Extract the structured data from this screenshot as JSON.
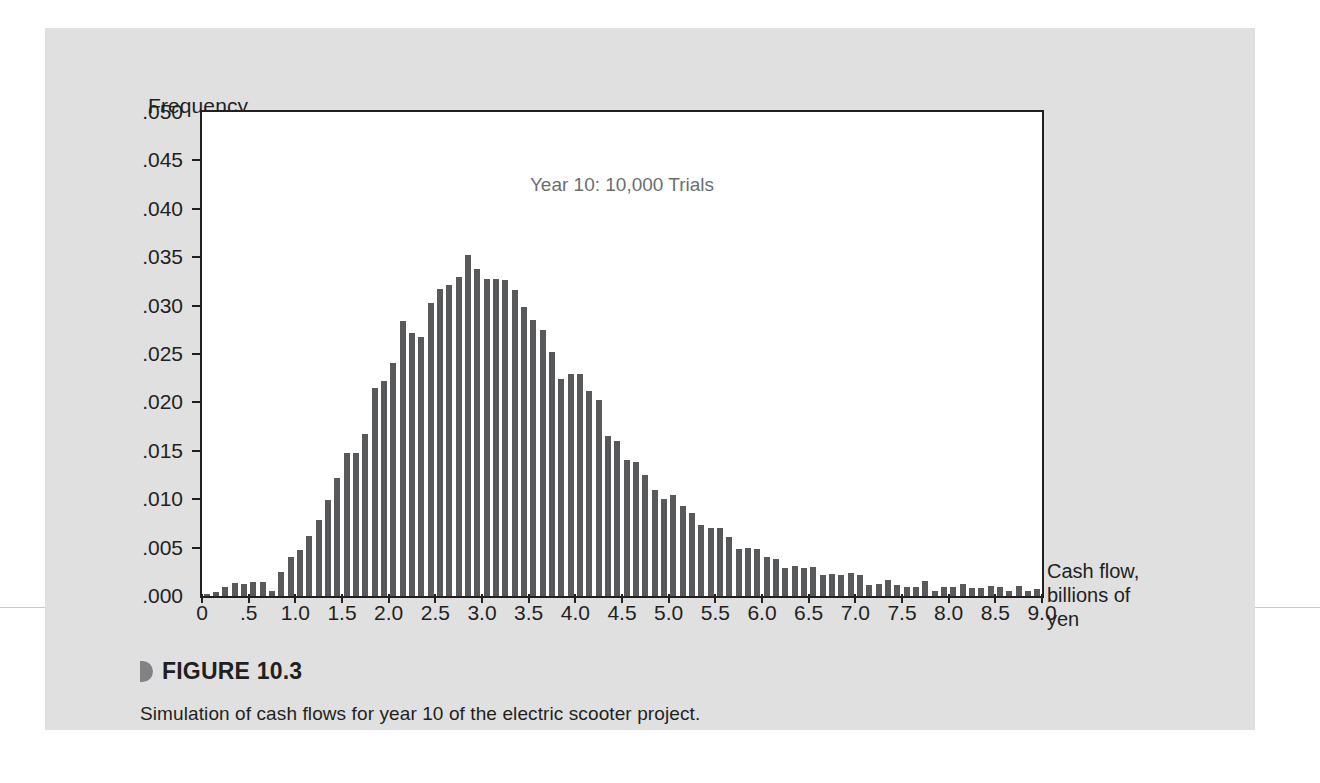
{
  "figure": {
    "label": "FIGURE 10.3",
    "caption": "Simulation of cash flows for year 10 of the electric scooter project.",
    "bullet_icon": "triangle-bullet-icon"
  },
  "colors": {
    "panel_background": "#e0e0e0",
    "plot_background": "#ffffff",
    "bar": "#58595b",
    "axis": "#231f20",
    "annotation_text": "#6d6e71"
  },
  "chart_data": {
    "type": "bar",
    "title": "Year 10: 10,000 Trials",
    "xlabel": "Cash flow, billions of yen",
    "xlabel_lines": [
      "Cash flow,",
      "billions of",
      "yen"
    ],
    "ylabel": "Frequency",
    "grid": false,
    "legend": null,
    "xlim": [
      0,
      9.0
    ],
    "ylim": [
      0.0,
      0.05
    ],
    "bin_width": 0.1,
    "xtick_labels": [
      "0",
      ".5",
      "1.0",
      "1.5",
      "2.0",
      "2.5",
      "3.0",
      "3.5",
      "4.0",
      "4.5",
      "5.0",
      "5.5",
      "6.0",
      "6.5",
      "7.0",
      "7.5",
      "8.0",
      "8.5",
      "9.0"
    ],
    "xtick_values": [
      0,
      0.5,
      1.0,
      1.5,
      2.0,
      2.5,
      3.0,
      3.5,
      4.0,
      4.5,
      5.0,
      5.5,
      6.0,
      6.5,
      7.0,
      7.5,
      8.0,
      8.5,
      9.0
    ],
    "ytick_labels": [
      ".050",
      ".045",
      ".040",
      ".035",
      ".030",
      ".025",
      ".020",
      ".015",
      ".010",
      ".005",
      ".000"
    ],
    "ytick_values": [
      0.05,
      0.045,
      0.04,
      0.035,
      0.03,
      0.025,
      0.02,
      0.015,
      0.01,
      0.005,
      0.0
    ],
    "x": [
      0.05,
      0.15,
      0.25,
      0.35,
      0.45,
      0.55,
      0.65,
      0.75,
      0.85,
      0.95,
      1.05,
      1.15,
      1.25,
      1.35,
      1.45,
      1.55,
      1.65,
      1.75,
      1.85,
      1.95,
      2.05,
      2.15,
      2.25,
      2.35,
      2.45,
      2.55,
      2.65,
      2.75,
      2.85,
      2.95,
      3.05,
      3.15,
      3.25,
      3.35,
      3.45,
      3.55,
      3.65,
      3.75,
      3.85,
      3.95,
      4.05,
      4.15,
      4.25,
      4.35,
      4.45,
      4.55,
      4.65,
      4.75,
      4.85,
      4.95,
      5.05,
      5.15,
      5.25,
      5.35,
      5.45,
      5.55,
      5.65,
      5.75,
      5.85,
      5.95,
      6.05,
      6.15,
      6.25,
      6.35,
      6.45,
      6.55,
      6.65,
      6.75,
      6.85,
      6.95,
      7.05,
      7.15,
      7.25,
      7.35,
      7.45,
      7.55,
      7.65,
      7.75,
      7.85,
      7.95,
      8.05,
      8.15,
      8.25,
      8.35,
      8.45,
      8.55,
      8.65,
      8.75,
      8.85,
      8.95
    ],
    "values": [
      0.0002,
      0.0004,
      0.0009,
      0.0013,
      0.0012,
      0.0014,
      0.0014,
      0.0005,
      0.0025,
      0.004,
      0.0048,
      0.0062,
      0.0079,
      0.0099,
      0.0122,
      0.0148,
      0.0148,
      0.0167,
      0.0215,
      0.0222,
      0.0241,
      0.0284,
      0.0272,
      0.0268,
      0.0303,
      0.0317,
      0.0321,
      0.033,
      0.0352,
      0.0338,
      0.0327,
      0.0327,
      0.0326,
      0.0316,
      0.0299,
      0.0285,
      0.0275,
      0.0252,
      0.0224,
      0.0229,
      0.0229,
      0.0212,
      0.0202,
      0.0165,
      0.016,
      0.0141,
      0.0138,
      0.0125,
      0.011,
      0.01,
      0.0104,
      0.0093,
      0.0086,
      0.0073,
      0.007,
      0.007,
      0.0061,
      0.0049,
      0.005,
      0.0049,
      0.004,
      0.0038,
      0.0029,
      0.0031,
      0.0029,
      0.003,
      0.0022,
      0.0023,
      0.0022,
      0.0024,
      0.0022,
      0.0011,
      0.0012,
      0.0017,
      0.0011,
      0.0009,
      0.0009,
      0.0016,
      0.0005,
      0.0009,
      0.0009,
      0.0012,
      0.0008,
      0.0008,
      0.001,
      0.0009,
      0.0005,
      0.001,
      0.0005,
      0.0007
    ]
  }
}
